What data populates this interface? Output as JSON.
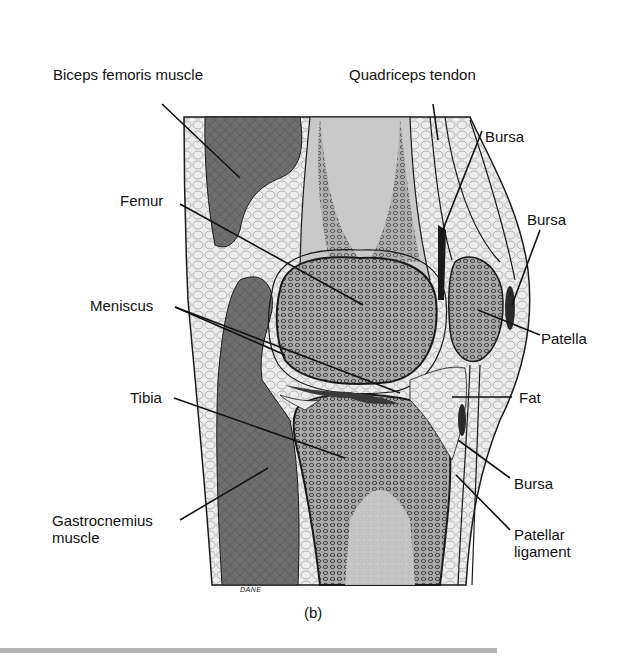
{
  "figure": {
    "caption": "(b)",
    "signature": "DANE",
    "colors": {
      "muscle": "#6f6f6f",
      "bone_spongy": "#8a8a8a",
      "marrow": "#c8c8c8",
      "fat": "#e9e9e9",
      "cartilage": "#f7f7f7",
      "outline": "#1a1a1a",
      "rule": "#b5b5b5"
    }
  },
  "labels": {
    "biceps_femoris": "Biceps femoris muscle",
    "quadriceps_tendon": "Quadriceps tendon",
    "bursa_upper": "Bursa",
    "femur": "Femur",
    "bursa_prepatellar": "Bursa",
    "meniscus": "Meniscus",
    "patella": "Patella",
    "tibia": "Tibia",
    "fat": "Fat",
    "bursa_infrapatellar": "Bursa",
    "gastrocnemius_line1": "Gastrocnemius",
    "gastrocnemius_line2": "muscle",
    "patellar_ligament_line1": "Patellar",
    "patellar_ligament_line2": "ligament"
  }
}
